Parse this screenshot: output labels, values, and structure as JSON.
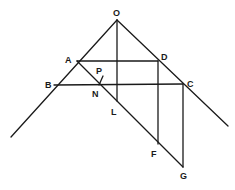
{
  "diagram": {
    "points": {
      "O": {
        "label": "O",
        "x": 117,
        "y": 20,
        "lx": 113,
        "ly": 16
      },
      "A": {
        "label": "A",
        "x": 77,
        "y": 61,
        "lx": 65,
        "ly": 63
      },
      "B": {
        "label": "B",
        "x": 54,
        "y": 85,
        "lx": 45,
        "ly": 88
      },
      "D": {
        "label": "D",
        "x": 158,
        "y": 61,
        "lx": 161,
        "ly": 60
      },
      "C": {
        "label": "C",
        "x": 183,
        "y": 84,
        "lx": 187,
        "ly": 87
      },
      "P": {
        "label": "P",
        "x": 102,
        "y": 76,
        "lx": 96,
        "ly": 74
      },
      "N": {
        "label": "N",
        "x": 99,
        "y": 85,
        "lx": 92,
        "ly": 97
      },
      "L": {
        "label": "L",
        "x": 117,
        "y": 101,
        "lx": 111,
        "ly": 115
      },
      "F": {
        "label": "F",
        "x": 158,
        "y": 144,
        "lx": 151,
        "ly": 157
      },
      "G": {
        "label": "G",
        "x": 183,
        "y": 167,
        "lx": 180,
        "ly": 179
      }
    },
    "segments": [
      {
        "name": "left-arm-OB-extended",
        "x1": 117,
        "y1": 20,
        "x2": 11,
        "y2": 137
      },
      {
        "name": "right-arm-OC-extended",
        "x1": 117,
        "y1": 20,
        "x2": 228,
        "y2": 126
      },
      {
        "name": "vertical-OL",
        "x1": 117,
        "y1": 20,
        "x2": 117,
        "y2": 101
      },
      {
        "name": "horizontal-AD",
        "x1": 77,
        "y1": 61,
        "x2": 158,
        "y2": 61
      },
      {
        "name": "horizontal-BC",
        "x1": 54,
        "y1": 85,
        "x2": 183,
        "y2": 84
      },
      {
        "name": "diagonal-AG",
        "x1": 77,
        "y1": 61,
        "x2": 183,
        "y2": 167
      },
      {
        "name": "vertical-DF",
        "x1": 158,
        "y1": 61,
        "x2": 158,
        "y2": 144
      },
      {
        "name": "vertical-CG",
        "x1": 183,
        "y1": 84,
        "x2": 183,
        "y2": 167
      },
      {
        "name": "tick-P",
        "x1": 99,
        "y1": 85,
        "x2": 103,
        "y2": 76
      }
    ]
  }
}
